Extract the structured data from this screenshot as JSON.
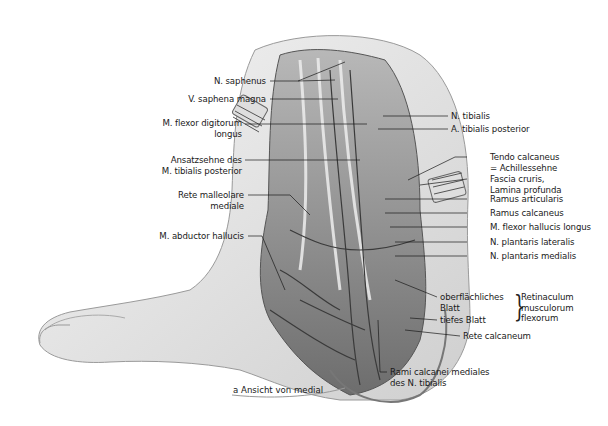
{
  "figure": {
    "type": "anatomical-illustration",
    "caption": "a  Ansicht von medial",
    "colors": {
      "background": "#ffffff",
      "ink": "#1a1a1a",
      "skin": "#e9e9e9",
      "shadow": "#9a9a9a",
      "deep": "#4a4a4a"
    }
  },
  "labels_left": [
    {
      "id": "n-saphenus",
      "lines": [
        "N. saphenus"
      ]
    },
    {
      "id": "v-saphena-magna",
      "lines": [
        "V. saphena magna"
      ]
    },
    {
      "id": "m-flexor-digitorum-longus",
      "lines": [
        "M. flexor digitorum",
        "longus"
      ]
    },
    {
      "id": "ansatzsehne",
      "lines": [
        "Ansatzsehne des",
        "M. tibialis posterior"
      ]
    },
    {
      "id": "rete-malleolare",
      "lines": [
        "Rete malleolare",
        "mediale"
      ]
    },
    {
      "id": "m-abductor-hallucis",
      "lines": [
        "M. abductor hallucis"
      ]
    }
  ],
  "labels_right": [
    {
      "id": "n-tibialis",
      "lines": [
        "N. tibialis"
      ]
    },
    {
      "id": "a-tibialis-posterior",
      "lines": [
        "A. tibialis posterior"
      ]
    },
    {
      "id": "tendo-calcaneus",
      "lines": [
        "Tendo calcaneus",
        "= Achillessehne"
      ]
    },
    {
      "id": "fascia-cruris",
      "lines": [
        "Fascia cruris,",
        "Lamina profunda"
      ]
    },
    {
      "id": "ramus-articularis",
      "lines": [
        "Ramus articularis"
      ]
    },
    {
      "id": "ramus-calcaneus",
      "lines": [
        "Ramus calcaneus"
      ]
    },
    {
      "id": "m-flexor-hallucis-longus",
      "lines": [
        "M. flexor hallucis longus"
      ]
    },
    {
      "id": "n-plantaris-lateralis",
      "lines": [
        "N. plantaris lateralis"
      ]
    },
    {
      "id": "n-plantaris-medialis",
      "lines": [
        "N. plantaris medialis"
      ]
    },
    {
      "id": "oberflaechliches-blatt",
      "lines": [
        "oberflächliches",
        "Blatt"
      ]
    },
    {
      "id": "tiefes-blatt",
      "lines": [
        "tiefes Blatt"
      ]
    },
    {
      "id": "retinaculum",
      "lines": [
        "Retinaculum",
        "musculorum",
        "flexorum"
      ]
    },
    {
      "id": "rete-calcaneum",
      "lines": [
        "Rete calcaneum"
      ]
    }
  ],
  "labels_bottom": [
    {
      "id": "rami-calcanei",
      "lines": [
        "Rami calcanei mediales",
        "des N. tibialis"
      ]
    }
  ]
}
